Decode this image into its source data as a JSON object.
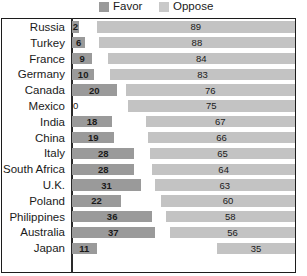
{
  "legend": {
    "items": [
      {
        "label": "Favor",
        "color": "#9a9a9a",
        "icon": "square-swatch-icon"
      },
      {
        "label": "Oppose",
        "color": "#c3c3c3",
        "icon": "square-swatch-icon"
      }
    ]
  },
  "chart_data": {
    "type": "bar",
    "orientation": "horizontal",
    "layout": "diverging-paired",
    "title": "",
    "subtitle": "",
    "xlabel": "",
    "ylabel": "",
    "xlim": [
      0,
      100
    ],
    "grid": false,
    "legend_position": "top",
    "categories": [
      "Russia",
      "Turkey",
      "France",
      "Germany",
      "Canada",
      "Mexico",
      "India",
      "China",
      "Italy",
      "South Africa",
      "U.K.",
      "Poland",
      "Philippines",
      "Australia",
      "Japan"
    ],
    "series": [
      {
        "name": "Favor",
        "color": "#9a9a9a",
        "values": [
          2,
          6,
          9,
          10,
          20,
          0,
          18,
          19,
          28,
          28,
          31,
          22,
          36,
          37,
          11
        ]
      },
      {
        "name": "Oppose",
        "color": "#c3c3c3",
        "values": [
          89,
          88,
          84,
          83,
          76,
          75,
          67,
          66,
          65,
          64,
          63,
          60,
          58,
          56,
          35
        ]
      }
    ],
    "rows": [
      {
        "label": "Russia",
        "favor": 2,
        "oppose": 89
      },
      {
        "label": "Turkey",
        "favor": 6,
        "oppose": 88
      },
      {
        "label": "France",
        "favor": 9,
        "oppose": 84
      },
      {
        "label": "Germany",
        "favor": 10,
        "oppose": 83
      },
      {
        "label": "Canada",
        "favor": 20,
        "oppose": 76
      },
      {
        "label": "Mexico",
        "favor": 0,
        "oppose": 75
      },
      {
        "label": "India",
        "favor": 18,
        "oppose": 67
      },
      {
        "label": "China",
        "favor": 19,
        "oppose": 66
      },
      {
        "label": "Italy",
        "favor": 28,
        "oppose": 65
      },
      {
        "label": "South Africa",
        "favor": 28,
        "oppose": 64
      },
      {
        "label": "U.K.",
        "favor": 31,
        "oppose": 63
      },
      {
        "label": "Poland",
        "favor": 22,
        "oppose": 60
      },
      {
        "label": "Philippines",
        "favor": 36,
        "oppose": 58
      },
      {
        "label": "Australia",
        "favor": 37,
        "oppose": 56
      },
      {
        "label": "Japan",
        "favor": 11,
        "oppose": 35
      }
    ]
  }
}
